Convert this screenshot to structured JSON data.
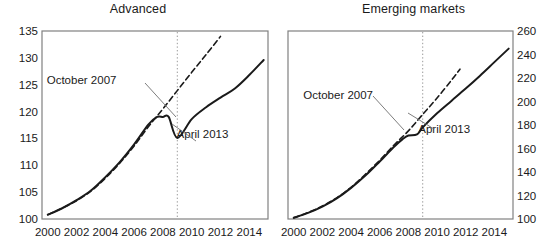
{
  "figure": {
    "panels": [
      {
        "id": "advanced",
        "title": "Advanced",
        "y_axis_side": "left",
        "ylim": [
          100,
          135
        ],
        "yticks": [
          100,
          105,
          110,
          115,
          120,
          125,
          130,
          135
        ],
        "ytick_labels": [
          "100",
          "105",
          "110",
          "115",
          "120",
          "125",
          "130",
          "135"
        ],
        "xlim": [
          1999.6,
          2015.3
        ],
        "xticks": [
          2000,
          2002,
          2004,
          2006,
          2008,
          2010,
          2012,
          2014
        ],
        "xtick_labels": [
          "2000",
          "2002",
          "2004",
          "2006",
          "2008",
          "2010",
          "2012",
          "2014"
        ],
        "vline_x": 2009,
        "annotations": [
          {
            "name": "october-2007-label",
            "text": "October 2007",
            "x": 2002.35,
            "y": 125.2
          },
          {
            "name": "april-2013-label",
            "text": "April 2013",
            "x": 2010.75,
            "y": 115.0
          }
        ],
        "series": [
          {
            "name": "October 2007",
            "style": "dashed",
            "x": [
              2000,
              2001,
              2002,
              2003,
              2004,
              2005,
              2006,
              2007,
              2008,
              2009,
              2010,
              2011,
              2012
            ],
            "values": [
              100.8,
              102.0,
              103.4,
              105.2,
              107.6,
              110.4,
              113.6,
              117.2,
              120.5,
              123.9,
              127.3,
              130.6,
              134.0
            ]
          },
          {
            "name": "April 2013",
            "style": "solid",
            "x": [
              2000,
              2001,
              2002,
              2003,
              2004,
              2005,
              2006,
              2007,
              2007.6,
              2008,
              2008.4,
              2009,
              2010,
              2011,
              2012,
              2013,
              2014,
              2015
            ],
            "values": [
              100.8,
              102.0,
              103.5,
              105.3,
              107.8,
              110.6,
              113.9,
              117.6,
              119.0,
              119.0,
              119.0,
              115.1,
              118.6,
              120.8,
              122.6,
              124.3,
              126.8,
              129.6
            ]
          }
        ]
      },
      {
        "id": "emerging-markets",
        "title": "Emerging markets",
        "y_axis_side": "right",
        "ylim": [
          100,
          260
        ],
        "yticks": [
          100,
          120,
          140,
          160,
          180,
          200,
          220,
          240,
          260
        ],
        "ytick_labels": [
          "100",
          "120",
          "140",
          "160",
          "180",
          "200",
          "220",
          "240",
          "260"
        ],
        "xlim": [
          1999.6,
          2015.3
        ],
        "xticks": [
          2000,
          2002,
          2004,
          2006,
          2008,
          2010,
          2012,
          2014
        ],
        "xtick_labels": [
          "2000",
          "2002",
          "2004",
          "2006",
          "2008",
          "2010",
          "2012",
          "2014"
        ],
        "vline_x": 2009,
        "annotations": [
          {
            "name": "october-2007-label",
            "text": "October 2007",
            "x": 2003.1,
            "y": 202.0
          },
          {
            "name": "april-2013-label",
            "text": "April 2013",
            "x": 2010.5,
            "y": 173.0
          }
        ],
        "series": [
          {
            "name": "October 2007",
            "style": "dashed",
            "x": [
              2000,
              2001,
              2002,
              2003,
              2004,
              2005,
              2006,
              2007,
              2008,
              2009,
              2010,
              2011,
              2011.6
            ],
            "values": [
              101.0,
              105.5,
              111.0,
              118.0,
              127.0,
              138.0,
              150.0,
              163.0,
              175.0,
              189.0,
              203.0,
              218.0,
              227.5
            ]
          },
          {
            "name": "April 2013",
            "style": "solid",
            "x": [
              2000,
              2001,
              2002,
              2003,
              2004,
              2005,
              2006,
              2007,
              2007.6,
              2008,
              2008.6,
              2009,
              2010,
              2011,
              2012,
              2013,
              2014,
              2015
            ],
            "values": [
              101.0,
              105.2,
              110.5,
              117.5,
              126.5,
              137.0,
              149.0,
              161.5,
              168.0,
              171.0,
              172.0,
              178.0,
              190.0,
              200.5,
              211.0,
              222.0,
              233.5,
              245.0
            ]
          }
        ]
      }
    ]
  },
  "chart_data": {
    "type": "line",
    "title": "",
    "subtitle": "",
    "xlabel": "",
    "ylabel": "",
    "grid": false,
    "legend": "annotated-inline",
    "panels": [
      {
        "title": "Advanced",
        "xlabel": "",
        "ylabel": "",
        "ylim": [
          100,
          135
        ],
        "yticks": [
          100,
          105,
          110,
          115,
          120,
          125,
          130,
          135
        ],
        "xticks": [
          2000,
          2002,
          2004,
          2006,
          2008,
          2010,
          2012,
          2014
        ],
        "axis_side": "left",
        "annotations": [
          "October 2007",
          "April 2013"
        ],
        "vertical_reference_line": 2009,
        "series": [
          {
            "name": "October 2007",
            "linestyle": "dashed",
            "x": [
              2000,
              2001,
              2002,
              2003,
              2004,
              2005,
              2006,
              2007,
              2008,
              2009,
              2010,
              2011,
              2012
            ],
            "values": [
              100.8,
              102.0,
              103.4,
              105.2,
              107.6,
              110.4,
              113.6,
              117.2,
              120.5,
              123.9,
              127.3,
              130.6,
              134.0
            ]
          },
          {
            "name": "April 2013",
            "linestyle": "solid",
            "x": [
              2000,
              2001,
              2002,
              2003,
              2004,
              2005,
              2006,
              2007,
              2008,
              2009,
              2010,
              2011,
              2012,
              2013,
              2014,
              2015
            ],
            "values": [
              100.8,
              102.0,
              103.5,
              105.3,
              107.8,
              110.6,
              113.9,
              119.0,
              119.0,
              115.1,
              118.6,
              120.8,
              122.6,
              124.3,
              126.8,
              129.6
            ]
          }
        ]
      },
      {
        "title": "Emerging markets",
        "xlabel": "",
        "ylabel": "",
        "ylim": [
          100,
          260
        ],
        "yticks": [
          100,
          120,
          140,
          160,
          180,
          200,
          220,
          240,
          260
        ],
        "xticks": [
          2000,
          2002,
          2004,
          2006,
          2008,
          2010,
          2012,
          2014
        ],
        "axis_side": "right",
        "annotations": [
          "October 2007",
          "April 2013"
        ],
        "vertical_reference_line": 2009,
        "series": [
          {
            "name": "October 2007",
            "linestyle": "dashed",
            "x": [
              2000,
              2001,
              2002,
              2003,
              2004,
              2005,
              2006,
              2007,
              2008,
              2009,
              2010,
              2011
            ],
            "values": [
              101.0,
              105.5,
              111.0,
              118.0,
              127.0,
              138.0,
              150.0,
              163.0,
              175.0,
              189.0,
              203.0,
              218.0
            ]
          },
          {
            "name": "April 2013",
            "linestyle": "solid",
            "x": [
              2000,
              2001,
              2002,
              2003,
              2004,
              2005,
              2006,
              2007,
              2008,
              2009,
              2010,
              2011,
              2012,
              2013,
              2014,
              2015
            ],
            "values": [
              101.0,
              105.2,
              110.5,
              117.5,
              126.5,
              137.0,
              149.0,
              161.5,
              171.0,
              178.0,
              190.0,
              200.5,
              211.0,
              222.0,
              233.5,
              245.0
            ]
          }
        ]
      }
    ]
  },
  "style": {
    "line_color": "#1a1a1a",
    "frame_color": "#808080",
    "vline_color": "#9a9a9a",
    "leader_color": "#6e6e6e",
    "background": "#ffffff"
  }
}
